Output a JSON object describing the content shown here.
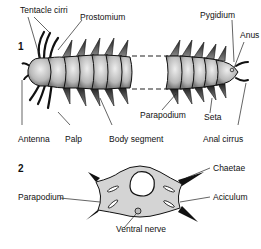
{
  "figure1": {
    "number": "1",
    "labels": {
      "tentacle_cirri": "Tentacle cirri",
      "prostomium": "Prostomium",
      "pygidium": "Pygidium",
      "anus": "Anus",
      "antenna": "Antenna",
      "palp": "Palp",
      "body_segment": "Body segment",
      "parapodium": "Parapodium",
      "seta": "Seta",
      "anal_cirrus": "Anal cirrus"
    }
  },
  "figure2": {
    "number": "2",
    "labels": {
      "chaetae": "Chaetae",
      "parapodium": "Parapodium",
      "aciculum": "Aciculum",
      "ventral_nerve": "Ventral nerve"
    }
  },
  "colors": {
    "body_fill": "#c8c8c8",
    "cross_section_fill": "#d4d4d4",
    "outline": "#111111"
  }
}
